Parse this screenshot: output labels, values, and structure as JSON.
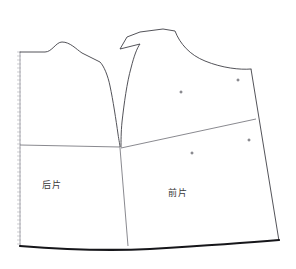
{
  "figure": {
    "kind": "garment-pattern-draft",
    "background_color": "#ffffff",
    "width": 296,
    "height": 269
  },
  "style": {
    "outline_color": "#3f3f46",
    "outline_width": 0.9,
    "hem_color": "#16161a",
    "hem_width": 2.2,
    "inner_line_color": "#6b6b72",
    "inner_line_width": 0.8,
    "foldmark_color": "#b9b9bf",
    "marker_color": "#4a4a52",
    "label_color": "#3a3a3a"
  },
  "pieces": [
    {
      "id": "back-piece",
      "label": "后片",
      "label_x": 52,
      "label_y": 184,
      "outline": "M 20 52 L 45 52 C 52 52 56 42 62 42 C 70 42 76 49 82 53 L 100 62 C 104 66 108 76 110 86 C 113 100 116 120 118 134 C 119 141 120 145 120 147"
    },
    {
      "id": "front-piece",
      "label": "前片",
      "label_x": 178,
      "label_y": 192,
      "outline": "M 121 147 C 121 142 121 132 122 122 C 124 104 127 82 131 68 C 134 56 137 48 140 44 L 120 49 L 127 37 L 140 32 L 163 29 L 175 31 C 180 44 190 55 205 61 C 222 68 240 70 251 69"
    }
  ],
  "construction_lines": [
    {
      "id": "waist-line-back",
      "description": "horizontal waistline across back piece",
      "path": "M 20 145 L 120 147"
    },
    {
      "id": "waist-line-front",
      "description": "rising waistline across front piece",
      "path": "M 121 148 L 256 119"
    },
    {
      "id": "side-seam",
      "description": "vertical side seam below armhole junction",
      "path": "M 120 148 L 128 246"
    },
    {
      "id": "left-fold-edge",
      "description": "center back fold edge",
      "path": "M 20 52 L 20 246"
    },
    {
      "id": "right-side-edge",
      "description": "front side edge sloping outward",
      "path": "M 251 69 L 279 241"
    }
  ],
  "hem": {
    "id": "hem-line",
    "description": "thick curved bottom hem",
    "path": "M 20 246 C 70 250 110 251 150 249 C 200 246 245 243 279 240"
  },
  "fold_marks": {
    "id": "fold-hatching",
    "description": "hatched center-back fold marking",
    "x": 17,
    "y_top": 52,
    "y_bottom": 246,
    "tick_spacing": 4,
    "tick_length": 4
  },
  "balance_markers": [
    {
      "id": "marker-front-upper-left",
      "x": 181,
      "y": 92,
      "size": 3
    },
    {
      "id": "marker-front-upper-right",
      "x": 238,
      "y": 80,
      "size": 3
    },
    {
      "id": "marker-front-lower-left",
      "x": 192,
      "y": 153,
      "size": 3
    },
    {
      "id": "marker-front-lower-right",
      "x": 249,
      "y": 140,
      "size": 3
    }
  ]
}
